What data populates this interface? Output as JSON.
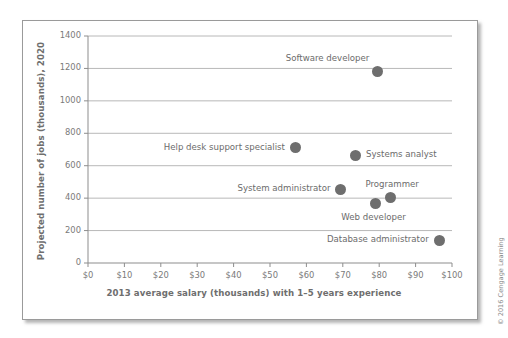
{
  "credit": "© 2016 Cengage Learning",
  "chart_data": {
    "type": "scatter",
    "title": "",
    "xlabel": "2013 average salary (thousands) with 1–5 years experience",
    "ylabel": "Projected number of jobs (thousands), 2020",
    "xlim": [
      0,
      100
    ],
    "ylim": [
      0,
      1400
    ],
    "grid": true,
    "legend": "none",
    "xticks": [
      0,
      10,
      20,
      30,
      40,
      50,
      60,
      70,
      80,
      90,
      100
    ],
    "xtick_labels": [
      "$0",
      "$10",
      "$20",
      "$30",
      "$40",
      "$50",
      "$60",
      "$70",
      "$80",
      "$90",
      "$100"
    ],
    "yticks": [
      0,
      200,
      400,
      600,
      800,
      1000,
      1200,
      1400
    ],
    "ytick_labels": [
      "0",
      "200",
      "400",
      "600",
      "800",
      "1000",
      "1200",
      "1400"
    ],
    "points": [
      {
        "label": "Software developer",
        "x": 79.5,
        "y": 1180,
        "label_side": "left-above"
      },
      {
        "label": "Help desk support specialist",
        "x": 57.0,
        "y": 710,
        "label_side": "left"
      },
      {
        "label": "Systems analyst",
        "x": 73.5,
        "y": 665,
        "label_side": "right"
      },
      {
        "label": "System administrator",
        "x": 69.5,
        "y": 455,
        "label_side": "left"
      },
      {
        "label": "Programmer",
        "x": 83.0,
        "y": 405,
        "label_side": "above"
      },
      {
        "label": "Web developer",
        "x": 79.0,
        "y": 370,
        "label_side": "below"
      },
      {
        "label": "Database administrator",
        "x": 96.5,
        "y": 140,
        "label_side": "left"
      }
    ],
    "colors": {
      "marker": "#6e6e6e",
      "grid": "#b8b8b8",
      "axis": "#8d8d8d",
      "text": "#6b6b6b"
    }
  }
}
